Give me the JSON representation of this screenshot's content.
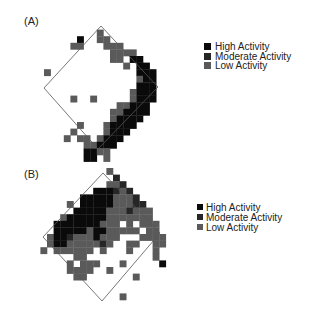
{
  "chart_data": [
    {
      "type": "heatmap",
      "panel_label": "(A)",
      "title": "",
      "legend": [
        {
          "label": "High Activity",
          "level": "high",
          "color": "#0a0a0a"
        },
        {
          "label": "Moderate Activity",
          "level": "moderate",
          "color": "#262626"
        },
        {
          "label": "Low Activity",
          "level": "low",
          "color": "#5a5a5a"
        }
      ],
      "legend_position": "right",
      "grid": false,
      "cells": [
        [
          "low",
          8,
          1
        ],
        [
          "high",
          5,
          2
        ],
        [
          "low",
          8,
          2
        ],
        [
          "low",
          9,
          2
        ],
        [
          "low",
          4,
          3
        ],
        [
          "low",
          5,
          3
        ],
        [
          "low",
          9,
          3
        ],
        [
          "low",
          10,
          3
        ],
        [
          "low",
          11,
          3
        ],
        [
          "low",
          10,
          4
        ],
        [
          "low",
          12,
          4
        ],
        [
          "low",
          11,
          4
        ],
        [
          "low",
          13,
          4
        ],
        [
          "low",
          10,
          5
        ],
        [
          "low",
          11,
          5
        ],
        [
          "low",
          13,
          5
        ],
        [
          "high",
          13,
          5
        ],
        [
          "high",
          14,
          5
        ],
        [
          "low",
          12,
          6
        ],
        [
          "high",
          14,
          6
        ],
        [
          "high",
          15,
          6
        ],
        [
          "low",
          0,
          7
        ],
        [
          "high",
          14,
          7
        ],
        [
          "high",
          15,
          7
        ],
        [
          "high",
          16,
          7
        ],
        [
          "low",
          14,
          8
        ],
        [
          "high",
          15,
          8
        ],
        [
          "high",
          16,
          8
        ],
        [
          "high",
          14,
          9
        ],
        [
          "high",
          15,
          9
        ],
        [
          "high",
          16,
          9
        ],
        [
          "low",
          13,
          10
        ],
        [
          "high",
          14,
          10
        ],
        [
          "high",
          15,
          10
        ],
        [
          "high",
          16,
          10
        ],
        [
          "low",
          4,
          11
        ],
        [
          "low",
          7,
          11
        ],
        [
          "low",
          13,
          11
        ],
        [
          "high",
          14,
          11
        ],
        [
          "high",
          15,
          11
        ],
        [
          "high",
          16,
          11
        ],
        [
          "low",
          11,
          12
        ],
        [
          "low",
          12,
          12
        ],
        [
          "high",
          13,
          12
        ],
        [
          "high",
          14,
          12
        ],
        [
          "high",
          15,
          12
        ],
        [
          "low",
          10,
          13
        ],
        [
          "low",
          11,
          13
        ],
        [
          "high",
          12,
          13
        ],
        [
          "high",
          13,
          13
        ],
        [
          "high",
          14,
          13
        ],
        [
          "high",
          15,
          13
        ],
        [
          "low",
          10,
          14
        ],
        [
          "high",
          11,
          14
        ],
        [
          "high",
          12,
          14
        ],
        [
          "high",
          13,
          14
        ],
        [
          "high",
          14,
          14
        ],
        [
          "low",
          5,
          15
        ],
        [
          "low",
          9,
          15
        ],
        [
          "high",
          10,
          15
        ],
        [
          "high",
          11,
          15
        ],
        [
          "high",
          12,
          15
        ],
        [
          "high",
          13,
          15
        ],
        [
          "low",
          4,
          16
        ],
        [
          "low",
          9,
          16
        ],
        [
          "high",
          10,
          16
        ],
        [
          "high",
          11,
          16
        ],
        [
          "high",
          12,
          16
        ],
        [
          "low",
          3,
          17
        ],
        [
          "low",
          5,
          17
        ],
        [
          "low",
          6,
          17
        ],
        [
          "low",
          8,
          17
        ],
        [
          "high",
          9,
          17
        ],
        [
          "high",
          10,
          17
        ],
        [
          "high",
          11,
          17
        ],
        [
          "low",
          6,
          18
        ],
        [
          "low",
          7,
          18
        ],
        [
          "high",
          8,
          18
        ],
        [
          "high",
          9,
          18
        ],
        [
          "high",
          10,
          18
        ],
        [
          "high",
          6,
          19
        ],
        [
          "high",
          7,
          19
        ],
        [
          "low",
          8,
          19
        ],
        [
          "low",
          9,
          19
        ],
        [
          "high",
          6,
          20
        ],
        [
          "high",
          7,
          20
        ],
        [
          "low",
          9,
          20
        ]
      ]
    },
    {
      "type": "heatmap",
      "panel_label": "(B)",
      "title": "",
      "legend": [
        {
          "label": "High Activity",
          "level": "high",
          "color": "#0a0a0a"
        },
        {
          "label": "Moderate Activity",
          "level": "moderate",
          "color": "#262626"
        },
        {
          "label": "Low Activity",
          "level": "low",
          "color": "#5a5a5a"
        }
      ],
      "legend_position": "right",
      "grid": false,
      "cells": [
        [
          "low",
          9,
          0
        ],
        [
          "moderate",
          10,
          1
        ],
        [
          "low",
          9,
          2
        ],
        [
          "low",
          10,
          2
        ],
        [
          "moderate",
          11,
          2
        ],
        [
          "high",
          7,
          3
        ],
        [
          "high",
          8,
          3
        ],
        [
          "high",
          9,
          3
        ],
        [
          "moderate",
          10,
          3
        ],
        [
          "low",
          11,
          3
        ],
        [
          "moderate",
          12,
          3
        ],
        [
          "high",
          5,
          4
        ],
        [
          "high",
          6,
          4
        ],
        [
          "high",
          7,
          4
        ],
        [
          "high",
          8,
          4
        ],
        [
          "high",
          9,
          4
        ],
        [
          "low",
          10,
          4
        ],
        [
          "low",
          11,
          4
        ],
        [
          "low",
          12,
          4
        ],
        [
          "moderate",
          13,
          4
        ],
        [
          "low",
          3,
          5
        ],
        [
          "high",
          5,
          5
        ],
        [
          "high",
          6,
          5
        ],
        [
          "high",
          7,
          5
        ],
        [
          "high",
          8,
          5
        ],
        [
          "high",
          9,
          5
        ],
        [
          "low",
          10,
          5
        ],
        [
          "low",
          11,
          5
        ],
        [
          "low",
          12,
          5
        ],
        [
          "moderate",
          13,
          5
        ],
        [
          "moderate",
          14,
          5
        ],
        [
          "high",
          4,
          6
        ],
        [
          "high",
          5,
          6
        ],
        [
          "high",
          6,
          6
        ],
        [
          "high",
          7,
          6
        ],
        [
          "high",
          8,
          6
        ],
        [
          "low",
          9,
          6
        ],
        [
          "low",
          10,
          6
        ],
        [
          "low",
          11,
          6
        ],
        [
          "moderate",
          12,
          6
        ],
        [
          "low",
          13,
          6
        ],
        [
          "low",
          14,
          6
        ],
        [
          "low",
          15,
          6
        ],
        [
          "low",
          2,
          7
        ],
        [
          "high",
          3,
          7
        ],
        [
          "high",
          4,
          7
        ],
        [
          "high",
          5,
          7
        ],
        [
          "high",
          6,
          7
        ],
        [
          "high",
          7,
          7
        ],
        [
          "high",
          8,
          7
        ],
        [
          "low",
          9,
          7
        ],
        [
          "low",
          10,
          7
        ],
        [
          "low",
          11,
          7
        ],
        [
          "low",
          12,
          7
        ],
        [
          "low",
          13,
          7
        ],
        [
          "low",
          14,
          7
        ],
        [
          "low",
          15,
          7
        ],
        [
          "high",
          1,
          8
        ],
        [
          "high",
          2,
          8
        ],
        [
          "high",
          3,
          8
        ],
        [
          "high",
          4,
          8
        ],
        [
          "high",
          5,
          8
        ],
        [
          "high",
          6,
          8
        ],
        [
          "high",
          7,
          8
        ],
        [
          "low",
          8,
          8
        ],
        [
          "low",
          9,
          8
        ],
        [
          "low",
          10,
          8
        ],
        [
          "low",
          12,
          8
        ],
        [
          "low",
          14,
          8
        ],
        [
          "low",
          15,
          8
        ],
        [
          "low",
          16,
          8
        ],
        [
          "high",
          1,
          9
        ],
        [
          "high",
          2,
          9
        ],
        [
          "high",
          3,
          9
        ],
        [
          "high",
          4,
          9
        ],
        [
          "high",
          5,
          9
        ],
        [
          "low",
          6,
          9
        ],
        [
          "high",
          7,
          9
        ],
        [
          "high",
          8,
          9
        ],
        [
          "low",
          9,
          9
        ],
        [
          "low",
          10,
          9
        ],
        [
          "low",
          11,
          9
        ],
        [
          "low",
          12,
          9
        ],
        [
          "low",
          13,
          9
        ],
        [
          "low",
          15,
          9
        ],
        [
          "low",
          16,
          9
        ],
        [
          "low",
          0,
          10
        ],
        [
          "high",
          1,
          10
        ],
        [
          "high",
          2,
          10
        ],
        [
          "moderate",
          3,
          10
        ],
        [
          "low",
          4,
          10
        ],
        [
          "low",
          5,
          10
        ],
        [
          "low",
          6,
          10
        ],
        [
          "high",
          7,
          10
        ],
        [
          "low",
          8,
          10
        ],
        [
          "low",
          9,
          10
        ],
        [
          "low",
          10,
          10
        ],
        [
          "low",
          14,
          10
        ],
        [
          "low",
          15,
          10
        ],
        [
          "low",
          16,
          10
        ],
        [
          "low",
          17,
          10
        ],
        [
          "low",
          0,
          11
        ],
        [
          "high",
          1,
          11
        ],
        [
          "high",
          2,
          11
        ],
        [
          "low",
          3,
          11
        ],
        [
          "low",
          4,
          11
        ],
        [
          "low",
          5,
          11
        ],
        [
          "low",
          6,
          11
        ],
        [
          "low",
          7,
          11
        ],
        [
          "moderate",
          8,
          11
        ],
        [
          "low",
          9,
          11
        ],
        [
          "low",
          12,
          11
        ],
        [
          "low",
          13,
          11
        ],
        [
          "low",
          16,
          11
        ],
        [
          "low",
          17,
          11
        ],
        [
          "low",
          -1,
          12
        ],
        [
          "low",
          1,
          12
        ],
        [
          "low",
          2,
          12
        ],
        [
          "low",
          3,
          12
        ],
        [
          "low",
          4,
          12
        ],
        [
          "low",
          5,
          12
        ],
        [
          "low",
          6,
          12
        ],
        [
          "low",
          8,
          12
        ],
        [
          "low",
          12,
          12
        ],
        [
          "low",
          16,
          12
        ],
        [
          "low",
          4,
          13
        ],
        [
          "low",
          5,
          13
        ],
        [
          "low",
          16,
          13
        ],
        [
          "low",
          3,
          14
        ],
        [
          "low",
          5,
          14
        ],
        [
          "low",
          6,
          14
        ],
        [
          "low",
          7,
          14
        ],
        [
          "low",
          11,
          14
        ],
        [
          "high",
          17,
          14
        ],
        [
          "low",
          3,
          15
        ],
        [
          "low",
          4,
          15
        ],
        [
          "low",
          5,
          15
        ],
        [
          "low",
          6,
          15
        ],
        [
          "low",
          9,
          15
        ],
        [
          "low",
          4,
          16
        ],
        [
          "low",
          5,
          16
        ],
        [
          "low",
          13,
          16
        ],
        [
          "low",
          11,
          19
        ]
      ]
    }
  ]
}
